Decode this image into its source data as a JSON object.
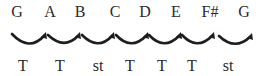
{
  "diagram": {
    "notes": [
      {
        "label": "G",
        "x": 17
      },
      {
        "label": "A",
        "x": 50
      },
      {
        "label": "B",
        "x": 80
      },
      {
        "label": "C",
        "x": 115
      },
      {
        "label": "D",
        "x": 145
      },
      {
        "label": "E",
        "x": 176
      },
      {
        "label": "F#",
        "x": 210
      },
      {
        "label": "G",
        "x": 244
      }
    ],
    "steps": [
      {
        "label": "T",
        "x": 23,
        "x1": 12,
        "x2": 46
      },
      {
        "label": "T",
        "x": 60,
        "x1": 47,
        "x2": 80
      },
      {
        "label": "st",
        "x": 98,
        "x1": 81,
        "x2": 114
      },
      {
        "label": "T",
        "x": 130,
        "x1": 115,
        "x2": 148
      },
      {
        "label": "T",
        "x": 162,
        "x1": 148,
        "x2": 181
      },
      {
        "label": "T",
        "x": 192,
        "x1": 181,
        "x2": 214
      },
      {
        "label": "st",
        "x": 228,
        "x1": 218,
        "x2": 252
      }
    ],
    "arc_color": "#1e1e1e",
    "text_color": "#2a2a2a"
  }
}
